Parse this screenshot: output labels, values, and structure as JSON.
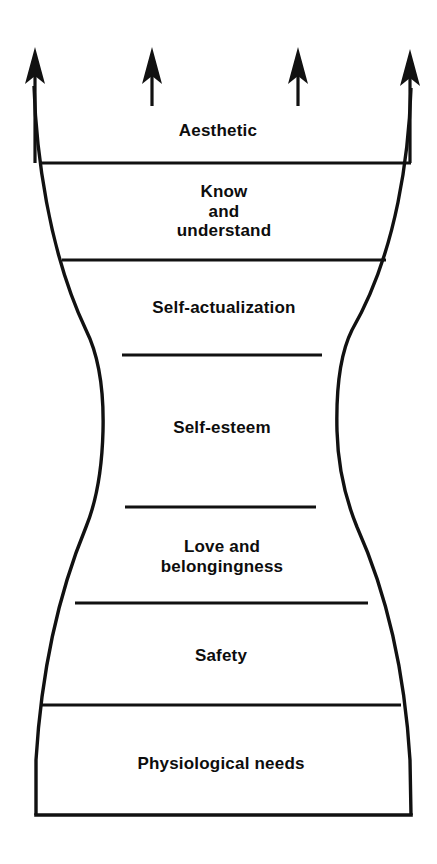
{
  "diagram": {
    "name": "maslow-extended-needs-hierarchy",
    "shape": "hourglass-vase-outline",
    "background_color": "#ffffff",
    "stroke_color": "#111111",
    "text_color": "#0d0d0d",
    "arrows": {
      "count": 4,
      "direction": "up",
      "icon": "up-arrow-icon",
      "items": [
        {
          "id": "arrow-outer-left",
          "x": 35,
          "tip_y": 50,
          "tail_y": 163,
          "length": "long",
          "shaft_width": 3
        },
        {
          "id": "arrow-inner-left",
          "x": 152,
          "tip_y": 50,
          "tail_y": 105,
          "length": "short",
          "shaft_width": 3
        },
        {
          "id": "arrow-inner-right",
          "x": 298,
          "tip_y": 50,
          "tail_y": 105,
          "length": "short",
          "shaft_width": 3
        },
        {
          "id": "arrow-outer-right",
          "x": 410,
          "tip_y": 52,
          "tail_y": 163,
          "length": "long",
          "shaft_width": 3
        }
      ]
    },
    "tiers": [
      {
        "id": "aesthetic",
        "label": "Aesthetic",
        "order": 7,
        "cx": 218,
        "cy": 131,
        "font_size": 17,
        "lines": 1
      },
      {
        "id": "know-and-understand",
        "label": "Know\nand\nunderstand",
        "order": 6,
        "cx": 224,
        "cy": 212,
        "font_size": 17,
        "lines": 3
      },
      {
        "id": "self-actualization",
        "label": "Self-actualization",
        "order": 5,
        "cx": 224,
        "cy": 308,
        "font_size": 17,
        "lines": 1
      },
      {
        "id": "self-esteem",
        "label": "Self-esteem",
        "order": 4,
        "cx": 222,
        "cy": 428,
        "font_size": 17,
        "lines": 1
      },
      {
        "id": "love-and-belongingness",
        "label": "Love and\nbelongingness",
        "order": 3,
        "cx": 222,
        "cy": 557,
        "font_size": 17,
        "lines": 2
      },
      {
        "id": "safety",
        "label": "Safety",
        "order": 2,
        "cx": 221,
        "cy": 656,
        "font_size": 17,
        "lines": 1
      },
      {
        "id": "physiological-needs",
        "label": "Physiological needs",
        "order": 1,
        "cx": 221,
        "cy": 764,
        "font_size": 17,
        "lines": 1
      }
    ],
    "dividers": [
      {
        "id": "divider-aesthetic-know",
        "y": 163,
        "x1": 39,
        "x2": 411
      },
      {
        "id": "divider-know-selfactualization",
        "y": 260,
        "x1": 62,
        "x2": 386
      },
      {
        "id": "divider-selfactualization-esteem",
        "y": 355,
        "x1": 122,
        "x2": 322
      },
      {
        "id": "divider-esteem-love",
        "y": 507,
        "x1": 125,
        "x2": 316
      },
      {
        "id": "divider-love-safety",
        "y": 603,
        "x1": 75,
        "x2": 368
      },
      {
        "id": "divider-safety-physiological",
        "y": 705,
        "x1": 42,
        "x2": 401
      }
    ],
    "outline": {
      "bottom_y": 815,
      "bottom_x1": 36,
      "bottom_x2": 411,
      "top_left_x": 33,
      "top_right_x": 412,
      "waist_left_x": 103,
      "waist_right_x": 337,
      "waist_y": 431
    }
  }
}
